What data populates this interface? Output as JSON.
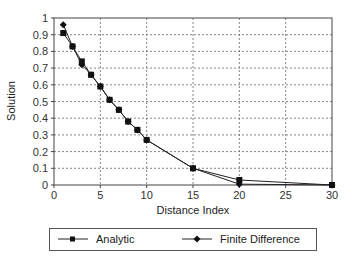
{
  "chart_data": {
    "type": "line",
    "title": "",
    "xlabel": "Distance Index",
    "ylabel": "Solution",
    "xlim": [
      0,
      30
    ],
    "ylim": [
      0,
      1
    ],
    "xticks": [
      0,
      5,
      10,
      15,
      20,
      25,
      30
    ],
    "yticks": [
      0,
      0.1,
      0.2,
      0.3,
      0.4,
      0.5,
      0.6,
      0.7,
      0.8,
      0.9,
      1
    ],
    "xtick_labels": [
      "0",
      "5",
      "10",
      "15",
      "20",
      "25",
      "30"
    ],
    "ytick_labels": [
      "0",
      "0.1",
      "0.2",
      "0.3",
      "0.4",
      "0.5",
      "0.6",
      "0.7",
      "0.8",
      "0.9",
      "1"
    ],
    "grid": true,
    "legend_position": "bottom",
    "series": [
      {
        "name": "Analytic",
        "marker": "square",
        "x": [
          1,
          2,
          3,
          4,
          5,
          6,
          7,
          8,
          9,
          10,
          15,
          20,
          30
        ],
        "y": [
          0.91,
          0.83,
          0.74,
          0.66,
          0.59,
          0.51,
          0.45,
          0.38,
          0.33,
          0.27,
          0.1,
          0.03,
          0.0
        ]
      },
      {
        "name": "Finite Difference",
        "marker": "diamond",
        "x": [
          1,
          2,
          3,
          4,
          5,
          6,
          7,
          8,
          9,
          10,
          15,
          20,
          30
        ],
        "y": [
          0.96,
          0.83,
          0.72,
          0.66,
          0.59,
          0.51,
          0.45,
          0.38,
          0.33,
          0.27,
          0.1,
          0.005,
          0.0
        ]
      }
    ]
  },
  "legend": {
    "items": [
      {
        "label": "Analytic"
      },
      {
        "label": "Finite Difference"
      }
    ]
  },
  "axes": {
    "x_title": "Distance Index",
    "y_title": "Solution"
  }
}
